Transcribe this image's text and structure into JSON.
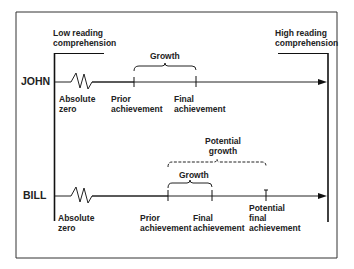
{
  "diagram": {
    "left_end": {
      "line1": "Low reading",
      "line2": "comprehension"
    },
    "right_end": {
      "line1": "High reading",
      "line2": "comprehension"
    },
    "john": {
      "name": "JOHN",
      "absolute_zero": {
        "line1": "Absolute",
        "line2": "zero"
      },
      "prior": {
        "line1": "Prior",
        "line2": "achievement"
      },
      "final": {
        "line1": "Final",
        "line2": "achievement"
      },
      "growth_label": "Growth"
    },
    "bill": {
      "name": "BILL",
      "absolute_zero": {
        "line1": "Absolute",
        "line2": "zero"
      },
      "prior": {
        "line1": "Prior",
        "line2": "achievement"
      },
      "final": {
        "line1": "Final",
        "line2": "achievement"
      },
      "potential_final": {
        "line1": "Potential",
        "line2": "final",
        "line3": "achievement"
      },
      "growth_label": "Growth",
      "potential_growth": {
        "line1": "Potential",
        "line2": "growth"
      }
    }
  }
}
